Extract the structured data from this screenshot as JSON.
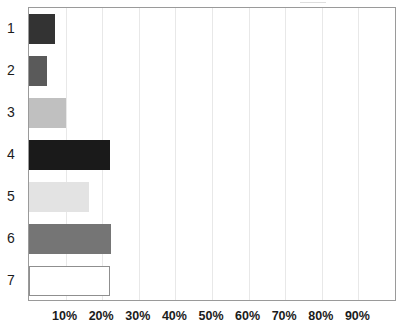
{
  "chart_data": {
    "type": "bar",
    "orientation": "horizontal",
    "title": "",
    "subtitle": "",
    "xlabel": "",
    "ylabel": "",
    "categories": [
      "1",
      "2",
      "3",
      "4",
      "5",
      "6",
      "7"
    ],
    "values": [
      7,
      5,
      10,
      22,
      16.5,
      22.5,
      22
    ],
    "value_unit": "%",
    "xlim": [
      0,
      100
    ],
    "xticks": [
      10,
      20,
      30,
      40,
      50,
      60,
      70,
      80,
      90
    ],
    "xtick_labels": [
      "10%",
      "20%",
      "30%",
      "40%",
      "50%",
      "60%",
      "70%",
      "80%",
      "90%"
    ],
    "grid": true,
    "grid_axis": "x",
    "legend": false,
    "legend_position": "none",
    "annotations": [],
    "bar_colors": [
      "#333333",
      "#5a5a5a",
      "#c0c0c0",
      "#1a1a1a",
      "#e3e3e3",
      "#757575",
      "#ffffff"
    ],
    "bar_border_colors": [
      "#333333",
      "#5a5a5a",
      "#c0c0c0",
      "#1a1a1a",
      "#e3e3e3",
      "#757575",
      "#8f8f8f"
    ],
    "series": [
      {
        "name": "Series 1",
        "points": [
          {
            "category": "1",
            "value": 7,
            "color": "#333333",
            "border": "#333333"
          },
          {
            "category": "2",
            "value": 5,
            "color": "#5a5a5a",
            "border": "#5a5a5a"
          },
          {
            "category": "3",
            "value": 10,
            "color": "#c0c0c0",
            "border": "#c0c0c0"
          },
          {
            "category": "4",
            "value": 22,
            "color": "#1a1a1a",
            "border": "#1a1a1a"
          },
          {
            "category": "5",
            "value": 16.5,
            "color": "#e3e3e3",
            "border": "#e3e3e3"
          },
          {
            "category": "6",
            "value": 22.5,
            "color": "#757575",
            "border": "#757575"
          },
          {
            "category": "7",
            "value": 22,
            "color": "#ffffff",
            "border": "#8f8f8f"
          }
        ]
      }
    ]
  },
  "axes": {
    "frame_color": "#9a9a9a",
    "gridline_color": "#e8e8e8",
    "tick_text_color": "#1b1b1b"
  }
}
